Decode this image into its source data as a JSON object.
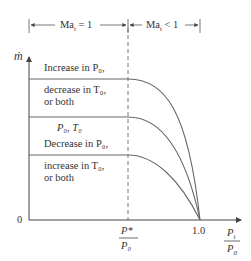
{
  "diagram": {
    "regions": {
      "left": {
        "label_main": "Ma",
        "label_sub": "t",
        "label_rel": " = 1"
      },
      "right": {
        "label_main": "Ma",
        "label_sub": "t",
        "label_rel": " < 1"
      }
    },
    "y_axis": {
      "label": "ṁ",
      "origin_label": "0"
    },
    "x_axis": {
      "critical_tick": {
        "num": "P*",
        "den": "P₀"
      },
      "unit_tick": "1.0",
      "label": {
        "num": "P",
        "num_sub": "t",
        "den": "P",
        "den_sub": "0"
      }
    },
    "curves": [
      {
        "id": "top",
        "lines": [
          "Increase in P₀,",
          "decrease in T₀,",
          "or both"
        ]
      },
      {
        "id": "middle",
        "lines": [
          "P₀, T₀"
        ]
      },
      {
        "id": "bottom",
        "lines": [
          "Decrease in P₀,",
          "increase in T₀,",
          "or both"
        ]
      }
    ],
    "colors": {
      "line": "#555555",
      "text": "#333333"
    }
  }
}
